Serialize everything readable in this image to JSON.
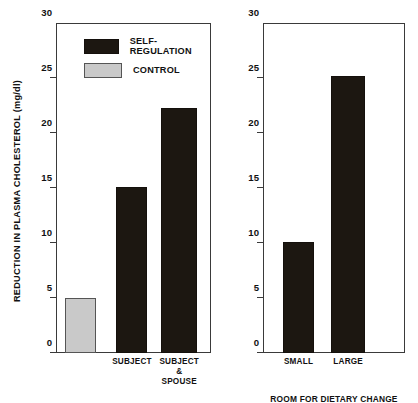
{
  "chart_data": [
    {
      "type": "bar",
      "panel": "left",
      "title": "",
      "xlabel": "",
      "ylabel": "REDUCTION IN PLASMA CHOLESTEROL (mg/dl)",
      "ylim": [
        0,
        30
      ],
      "yticks": [
        0,
        5,
        10,
        15,
        20,
        25,
        30
      ],
      "grid": false,
      "categories": [
        "",
        "SUBJECT",
        "SUBJECT\n& SPOUSE"
      ],
      "values": [
        5.0,
        15.1,
        22.3
      ],
      "bar_groups": [
        "CONTROL",
        "SELF-REGULATION",
        "SELF-REGULATION"
      ],
      "legend": {
        "position": "top-left",
        "entries": [
          {
            "label": "SELF-REGULATION",
            "color": "#1c1711",
            "swatch": "dark"
          },
          {
            "label": "CONTROL",
            "color": "#c9c9c9",
            "swatch": "light"
          }
        ]
      }
    },
    {
      "type": "bar",
      "panel": "right",
      "title": "",
      "xlabel": "ROOM FOR DIETARY CHANGE",
      "ylabel": "",
      "ylim": [
        0,
        30
      ],
      "yticks": [
        0,
        5,
        10,
        15,
        20,
        25,
        30
      ],
      "grid": false,
      "categories": [
        "SMALL",
        "LARGE"
      ],
      "values": [
        10.1,
        25.2
      ],
      "bar_groups": [
        "SELF-REGULATION",
        "SELF-REGULATION"
      ]
    }
  ],
  "colors": {
    "self_regulation": "#1c1711",
    "control": "#c9c9c9",
    "axis": "#3a3a3a",
    "text": "#111111",
    "background": "#ffffff"
  }
}
